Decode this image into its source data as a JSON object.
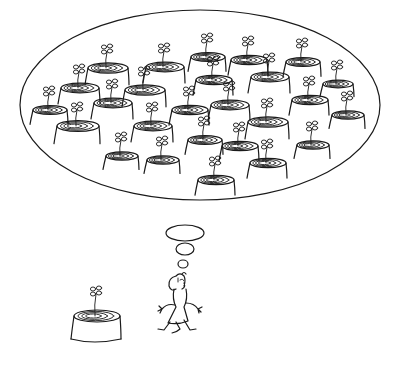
{
  "illustration": {
    "title": "Man dreaming of a forest of sprouting stumps",
    "style": "black ink line drawing on white",
    "ink_color": "#1a1a1a",
    "background_color": "#ffffff",
    "thought_bubble": {
      "cx": 200,
      "cy": 105,
      "rx": 180,
      "ry": 95,
      "trail_bubbles": [
        {
          "cx": 185,
          "cy": 233,
          "rx": 19,
          "ry": 8
        },
        {
          "cx": 185,
          "cy": 249,
          "rx": 9,
          "ry": 6
        },
        {
          "cx": 183,
          "cy": 264,
          "rx": 5,
          "ry": 4
        }
      ],
      "stumps": [
        {
          "x": 50,
          "y": 110,
          "w": 34
        },
        {
          "x": 80,
          "y": 88,
          "w": 38
        },
        {
          "x": 78,
          "y": 126,
          "w": 42
        },
        {
          "x": 108,
          "y": 68,
          "w": 40
        },
        {
          "x": 113,
          "y": 103,
          "w": 38
        },
        {
          "x": 145,
          "y": 90,
          "w": 40
        },
        {
          "x": 165,
          "y": 67,
          "w": 38
        },
        {
          "x": 153,
          "y": 126,
          "w": 38
        },
        {
          "x": 122,
          "y": 156,
          "w": 32
        },
        {
          "x": 163,
          "y": 160,
          "w": 32
        },
        {
          "x": 190,
          "y": 110,
          "w": 36
        },
        {
          "x": 208,
          "y": 57,
          "w": 34
        },
        {
          "x": 214,
          "y": 80,
          "w": 36
        },
        {
          "x": 230,
          "y": 105,
          "w": 38
        },
        {
          "x": 240,
          "y": 146,
          "w": 36
        },
        {
          "x": 205,
          "y": 140,
          "w": 34
        },
        {
          "x": 249,
          "y": 60,
          "w": 36
        },
        {
          "x": 270,
          "y": 77,
          "w": 38
        },
        {
          "x": 268,
          "y": 122,
          "w": 40
        },
        {
          "x": 303,
          "y": 62,
          "w": 34
        },
        {
          "x": 310,
          "y": 100,
          "w": 36
        },
        {
          "x": 313,
          "y": 145,
          "w": 32
        },
        {
          "x": 268,
          "y": 163,
          "w": 36
        },
        {
          "x": 338,
          "y": 84,
          "w": 30
        },
        {
          "x": 348,
          "y": 115,
          "w": 32
        },
        {
          "x": 216,
          "y": 180,
          "w": 36
        }
      ]
    },
    "real_stump": {
      "x": 97,
      "y": 316,
      "w": 46
    },
    "man": {
      "x": 180,
      "y": 280
    }
  }
}
